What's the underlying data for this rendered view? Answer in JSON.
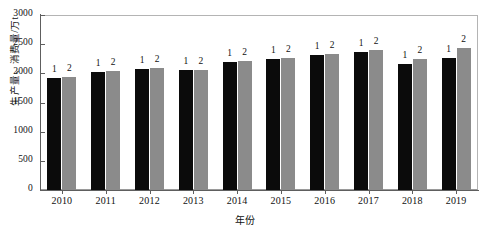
{
  "chart_data": {
    "type": "bar",
    "title": "",
    "xlabel": "年份",
    "ylabel": "生产量、消费量/万t",
    "categories": [
      "2010",
      "2011",
      "2012",
      "2013",
      "2014",
      "2015",
      "2016",
      "2017",
      "2018",
      "2019"
    ],
    "series": [
      {
        "name": "1",
        "label": "1",
        "color": "#0b0b0b",
        "values": [
          1920,
          2020,
          2070,
          2055,
          2195,
          2250,
          2320,
          2370,
          2160,
          2260
        ]
      },
      {
        "name": "2",
        "label": "2",
        "color": "#8b8b8b",
        "values": [
          1940,
          2035,
          2085,
          2060,
          2215,
          2255,
          2340,
          2395,
          2240,
          2430
        ]
      }
    ],
    "ylim": [
      0,
      3000
    ],
    "yticks": [
      0,
      500,
      1000,
      1500,
      2000,
      2500,
      3000
    ],
    "ytick_labels": [
      "0",
      "500",
      "1000",
      "1500",
      "2000",
      "2500",
      "3000"
    ],
    "grid": false,
    "legend": "none",
    "bar_value_labels": true
  }
}
